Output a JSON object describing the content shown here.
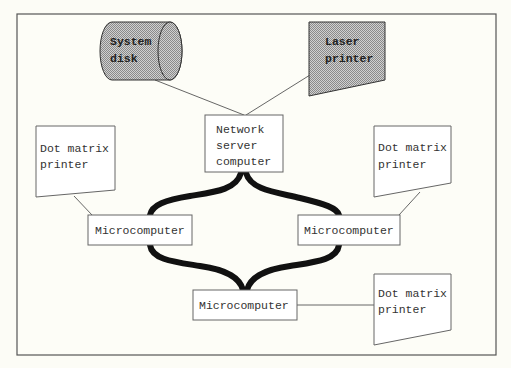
{
  "diagram": {
    "title": "",
    "colors": {
      "background": "#fcfcf6",
      "frame": "#555555",
      "shaded_fill": "#b8b8b8",
      "cable": "#111111",
      "line": "#555555"
    },
    "nodes": {
      "system_disk": {
        "line1": "System",
        "line2": "disk",
        "shape": "cylinder",
        "shaded": true
      },
      "laser_printer": {
        "line1": "Laser",
        "line2": "printer",
        "shape": "printer",
        "shaded": true
      },
      "network_server": {
        "line1": "Network",
        "line2": "server",
        "line3": "computer",
        "shape": "box"
      },
      "micro_left": {
        "label": "Microcomputer",
        "shape": "box"
      },
      "micro_right": {
        "label": "Microcomputer",
        "shape": "box"
      },
      "micro_bottom": {
        "label": "Microcomputer",
        "shape": "box"
      },
      "dot_printer_left": {
        "line1": "Dot matrix",
        "line2": "printer",
        "shape": "printer"
      },
      "dot_printer_right": {
        "line1": "Dot matrix",
        "line2": "printer",
        "shape": "printer"
      },
      "dot_printer_bottom": {
        "line1": "Dot matrix",
        "line2": "printer",
        "shape": "printer"
      }
    },
    "edges": [
      {
        "from": "system_disk",
        "to": "network_server",
        "style": "thin"
      },
      {
        "from": "laser_printer",
        "to": "network_server",
        "style": "thin"
      },
      {
        "from": "network_server",
        "to": "micro_left",
        "style": "thick-cable"
      },
      {
        "from": "network_server",
        "to": "micro_right",
        "style": "thick-cable"
      },
      {
        "from": "micro_left",
        "to": "micro_bottom",
        "style": "thick-cable"
      },
      {
        "from": "micro_right",
        "to": "micro_bottom",
        "style": "thick-cable"
      },
      {
        "from": "dot_printer_left",
        "to": "micro_left",
        "style": "thin"
      },
      {
        "from": "dot_printer_right",
        "to": "micro_right",
        "style": "thin"
      },
      {
        "from": "micro_bottom",
        "to": "dot_printer_bottom",
        "style": "thin"
      }
    ]
  }
}
